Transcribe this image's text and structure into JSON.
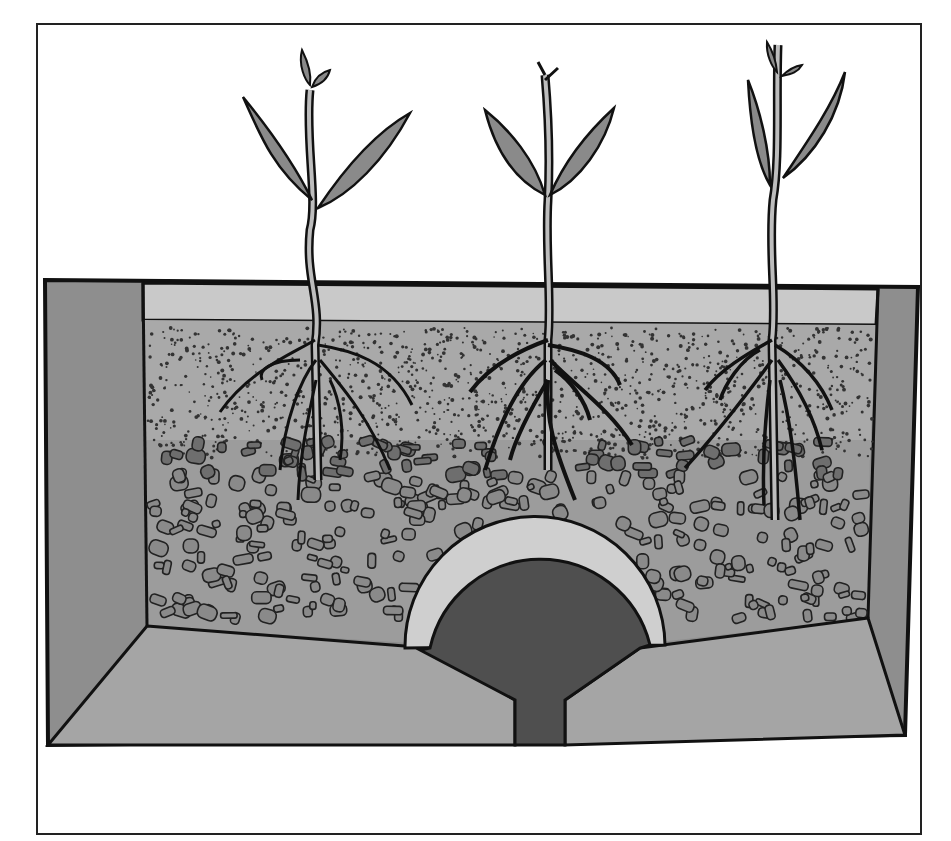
{
  "diagram": {
    "frame": {
      "x": 37,
      "y": 24,
      "width": 884,
      "height": 810
    },
    "layers": [
      {
        "name": "mulch-top-layer",
        "color": "#c9c9c9"
      },
      {
        "name": "fine-soil-layer",
        "color": "#a9a9a9"
      },
      {
        "name": "coarse-gravel-layer",
        "color": "#9c9c9c"
      },
      {
        "name": "concrete-walls",
        "color": "#8e8e8e"
      },
      {
        "name": "drain-pipe",
        "color": "#4f4f4f"
      }
    ],
    "plants": [
      {
        "name": "seedling-left",
        "x": 315
      },
      {
        "name": "seedling-middle",
        "x": 548
      },
      {
        "name": "seedling-right",
        "x": 773
      }
    ],
    "colors": {
      "outline": "#111111",
      "leaf": "#8a8a8a",
      "stem": "#bdbdbd",
      "wall": "#8e8e8e",
      "base": "#a5a5a5",
      "pipe_rim": "#cfcfcf",
      "pipe_fill": "#4f4f4f",
      "stone": "#8a8a8a"
    }
  }
}
